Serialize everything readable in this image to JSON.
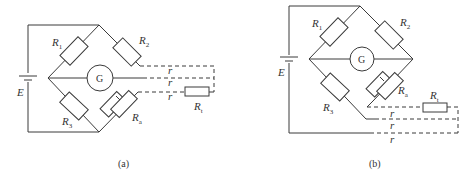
{
  "diagrams": [
    {
      "caption": "(a)",
      "labels": {
        "r1": "R",
        "r1_sub": "1",
        "r2": "R",
        "r2_sub": "2",
        "r3": "R",
        "r3_sub": "3",
        "ra": "R",
        "ra_sub": "a",
        "rt": "R",
        "rt_sub": "t",
        "e": "E",
        "g": "G",
        "r_line1": "r",
        "r_line2": "r",
        "r_line3": "r"
      }
    },
    {
      "caption": "(b)",
      "labels": {
        "r1": "R",
        "r1_sub": "1",
        "r2": "R",
        "r2_sub": "2",
        "r3": "R",
        "r3_sub": "3",
        "ra": "R",
        "ra_sub": "a",
        "rt": "R",
        "rt_sub": "t",
        "e": "E",
        "g": "G",
        "r_line1": "r",
        "r_line2": "r",
        "r_line3": "r"
      }
    }
  ]
}
